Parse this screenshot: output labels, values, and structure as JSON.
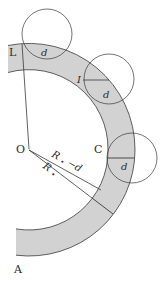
{
  "diagram": {
    "type": "curved-band-geometry",
    "colors": {
      "band_fill": "#d2d2d2",
      "stroke": "#3a3a3a",
      "background": "#ffffff"
    },
    "points": {
      "O": "O",
      "L": "L",
      "I": "I",
      "C": "C",
      "A": "A"
    },
    "circles": [
      {
        "id": "circle-L",
        "label": "d"
      },
      {
        "id": "circle-I",
        "label": "d"
      },
      {
        "id": "circle-C",
        "label": "d"
      }
    ],
    "radii": {
      "inner_label": "R",
      "inner_sub": "•",
      "inner_suffix": "−d",
      "outer_label": "R",
      "outer_sub": "•"
    }
  }
}
